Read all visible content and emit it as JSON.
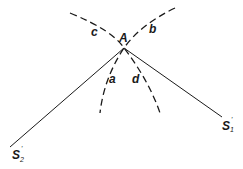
{
  "diagram": {
    "point_label": "A",
    "arc_labels": {
      "upper_left": "c",
      "upper_right": "b",
      "lower_left": "a",
      "lower_right": "d"
    },
    "ray_labels": {
      "right": {
        "base": "S",
        "prime": "'",
        "subscript": "1"
      },
      "left": {
        "base": "S",
        "prime": "'",
        "subscript": "2"
      }
    },
    "line_color": "#1a1a1a",
    "background": "#ffffff"
  }
}
